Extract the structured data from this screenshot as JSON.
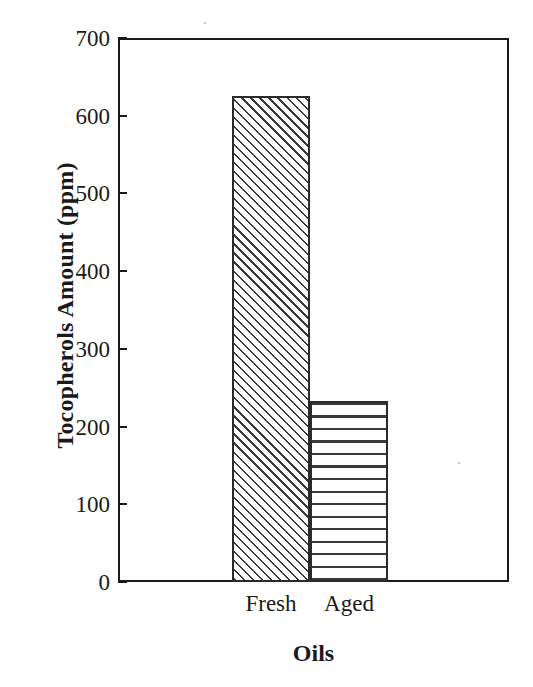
{
  "chart_data": {
    "type": "bar",
    "title": "",
    "subtitle": "",
    "xlabel": "Oils",
    "ylabel": "Tocopherols Amount (ppm)",
    "categories": [
      "Fresh",
      "Aged"
    ],
    "values": [
      625,
      233
    ],
    "series": [
      {
        "name": "Tocopherols Amount",
        "values": [
          625,
          233
        ]
      }
    ],
    "ylim": [
      0,
      700
    ],
    "ytick_labels": [
      "0",
      "100",
      "200",
      "300",
      "400",
      "500",
      "600",
      "700"
    ],
    "ytick_values": [
      0,
      100,
      200,
      300,
      400,
      500,
      600,
      700
    ],
    "grid": false,
    "legend": false,
    "legend_position": "none",
    "bar_fills": [
      "diagonal-hatch",
      "horizontal-hatch"
    ],
    "colors": {
      "axis": "#1a1a1a",
      "bar_outline": "#2b2b2b",
      "hatch": "#3a3a3a",
      "background": "#ffffff"
    },
    "annotations": []
  }
}
